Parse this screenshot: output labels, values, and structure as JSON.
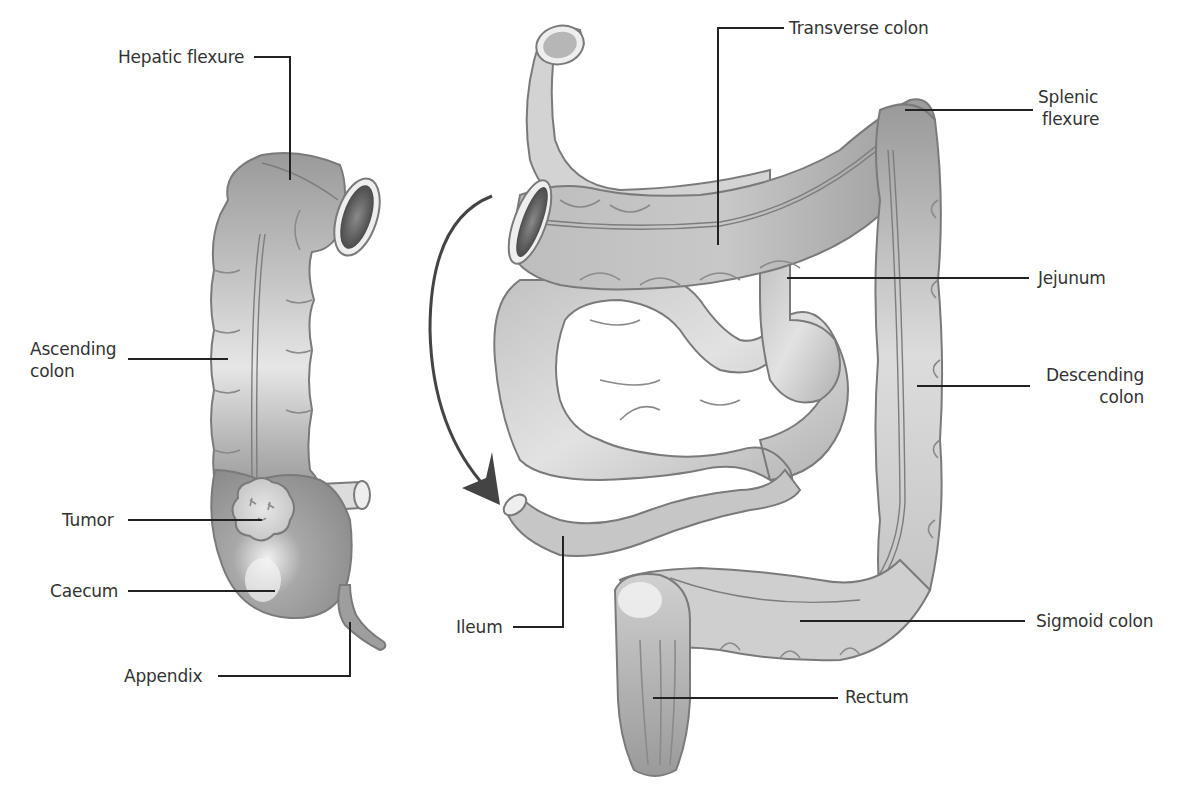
{
  "figure": {
    "type": "anatomical-diagram",
    "left_panel": {
      "name": "Right colon (ascending colon with caecum and tumor)",
      "labels": [
        {
          "id": "hepatic_flexure",
          "text": "Hepatic flexure"
        },
        {
          "id": "ascending_colon",
          "text": "Ascending colon",
          "line1": "Ascending",
          "line2": "colon"
        },
        {
          "id": "tumor",
          "text": "Tumor"
        },
        {
          "id": "caecum",
          "text": "Caecum"
        },
        {
          "id": "appendix",
          "text": "Appendix"
        }
      ]
    },
    "right_panel": {
      "name": "Remaining colon and small intestine after resection",
      "labels": [
        {
          "id": "transverse_colon",
          "text": "Transverse colon"
        },
        {
          "id": "splenic_flexure",
          "text": "Splenic flexure",
          "line1": "Splenic",
          "line2": "flexure"
        },
        {
          "id": "jejunum",
          "text": "Jejunum"
        },
        {
          "id": "descending_colon",
          "text": "Descending colon",
          "line1": "Descending",
          "line2": "colon"
        },
        {
          "id": "ileum",
          "text": "Ileum"
        },
        {
          "id": "sigmoid_colon",
          "text": "Sigmoid colon"
        },
        {
          "id": "rectum",
          "text": "Rectum"
        }
      ]
    },
    "arrow": {
      "meaning": "ileum joined to transverse colon (anastomosis)",
      "direction": "downward-curved"
    },
    "colors": {
      "label_text": "#333333",
      "leader_line": "#222222",
      "organ_fill_light": "#e8e8e8",
      "organ_fill_mid": "#bdbdbd",
      "organ_fill_dark": "#8c8c8c",
      "organ_outline": "#7a7a7a",
      "lumen": "#555555",
      "arrow": "#444444",
      "background": "#ffffff"
    }
  }
}
